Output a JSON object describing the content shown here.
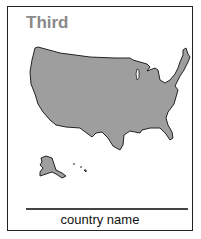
{
  "card": {
    "title": "Third",
    "caption": "country name",
    "map": {
      "name": "United States",
      "fill": "#9e9e9e",
      "stroke": "#222222"
    }
  }
}
